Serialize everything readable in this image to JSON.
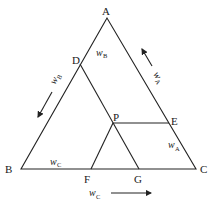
{
  "diagram": {
    "type": "ternary-triangle",
    "points": {
      "A": {
        "label": "A",
        "x": 107,
        "y": 18
      },
      "B": {
        "label": "B",
        "x": 21,
        "y": 169
      },
      "C": {
        "label": "C",
        "x": 196,
        "y": 169
      },
      "D": {
        "label": "D",
        "x": 80,
        "y": 64
      },
      "P": {
        "label": "P",
        "x": 113,
        "y": 123
      },
      "E": {
        "label": "E",
        "x": 169,
        "y": 123
      },
      "F": {
        "label": "F",
        "x": 91,
        "y": 169
      },
      "G": {
        "label": "G",
        "x": 139,
        "y": 169
      }
    },
    "segments": [
      "A-B",
      "B-C",
      "C-A",
      "D-G",
      "P-E",
      "P-F"
    ],
    "labels": {
      "wB_inner": {
        "base": "w",
        "sub": "B"
      },
      "wB_side": {
        "base": "w",
        "sub": "B"
      },
      "wA_side": {
        "base": "w",
        "sub": "A"
      },
      "wA_inner": {
        "base": "w",
        "sub": "A"
      },
      "wC_inner": {
        "base": "w",
        "sub": "C"
      },
      "wC_bottom": {
        "base": "w",
        "sub": "C"
      }
    },
    "arrows": {
      "wA": "up-along-CA",
      "wB": "down-along-AB",
      "wC": "right-along-BC"
    },
    "line_color": "#222222"
  }
}
